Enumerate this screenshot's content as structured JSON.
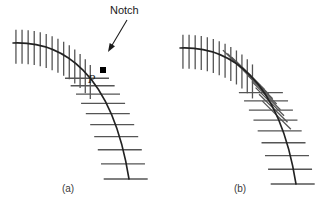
{
  "figure": {
    "title_present": false,
    "background_color": "#ffffff",
    "curve_color": "#222222",
    "hatch_color": "#555555",
    "marker_color": "#000000",
    "text_color": "#1a1a1a",
    "annotations": {
      "notch_label": "Notch",
      "point_label": "P"
    },
    "panels": [
      {
        "id": "a",
        "caption": "(a)",
        "caption_x": 68,
        "caption_y": 192,
        "description": "offset curve with notch where hatch marks cross",
        "curve": {
          "start_x": 13,
          "start_y": 43,
          "control1_x": 62,
          "control1_y": 41,
          "control2_x": 112,
          "control2_y": 72,
          "end_x": 129,
          "end_y": 179
        },
        "hatch_upper": {
          "count": 14,
          "orientation": "vertical",
          "length": 34,
          "t_start": 0.02,
          "t_end": 0.56
        },
        "hatch_lower": {
          "count": 10,
          "orientation": "horizontal",
          "length": 44,
          "t_start": 0.56,
          "t_end": 1.0
        },
        "marker": {
          "shape": "square",
          "x": 103,
          "y": 70,
          "size": 6
        },
        "label_p": {
          "x": 88,
          "y": 83
        }
      },
      {
        "id": "b",
        "caption": "(b)",
        "caption_x": 240,
        "caption_y": 192,
        "description": "offset curve with overlapping self-intersecting hatch marks",
        "curve": {
          "start_x": 180,
          "start_y": 48,
          "control1_x": 229,
          "control1_y": 46,
          "control2_x": 279,
          "control2_y": 77,
          "end_x": 296,
          "end_y": 184
        },
        "hatch_upper": {
          "count": 13,
          "orientation": "vertical",
          "length": 34,
          "t_start": 0.02,
          "t_end": 0.52
        },
        "hatch_mid": {
          "count": 11,
          "orientation": "diagonal",
          "length": 40,
          "t_start": 0.4,
          "t_end": 0.74
        },
        "hatch_lower": {
          "count": 9,
          "orientation": "horizontal",
          "length": 44,
          "t_start": 0.62,
          "t_end": 1.0
        }
      }
    ],
    "notch_annotation": {
      "text_x": 110,
      "text_y": 14,
      "arrow_start_x": 127,
      "arrow_start_y": 20,
      "arrow_end_x": 108,
      "arrow_end_y": 52
    }
  }
}
